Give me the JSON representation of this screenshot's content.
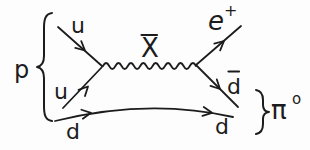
{
  "diagram": {
    "kind": "feynman-diagram",
    "labels": {
      "proton": "p",
      "up_quark_top": "u",
      "up_quark_bottom": "u",
      "down_quark_in": "d",
      "x_boson": "X",
      "positron": "e",
      "positron_charge": "+",
      "anti_down_quark": "d",
      "down_quark_out": "d",
      "pion": "π",
      "pion_superscript": "o"
    },
    "overbars": [
      "x_boson",
      "anti_down_quark"
    ],
    "colors": {
      "stroke": "#1c1c1c",
      "background": "#fdfdfd"
    }
  }
}
